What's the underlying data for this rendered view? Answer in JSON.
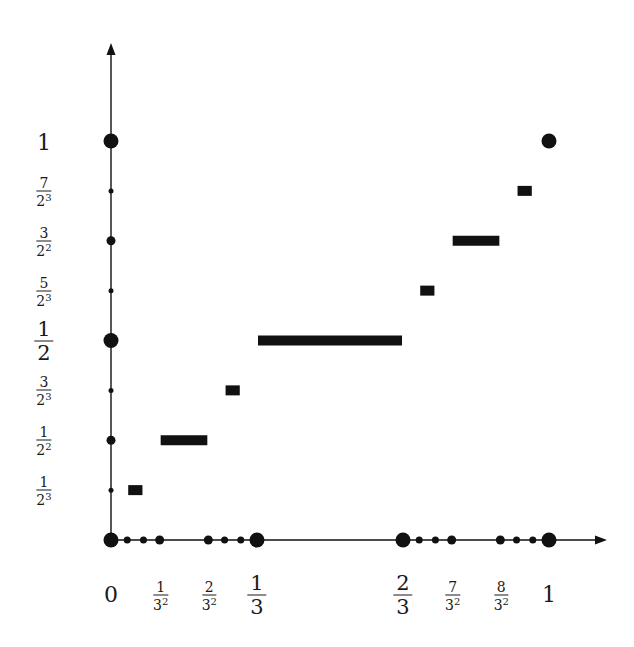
{
  "diagram": {
    "title": "",
    "colors": {
      "ink": "#111111",
      "background": "#ffffff"
    },
    "axes": {
      "origin_px": [
        111,
        540
      ],
      "x_end_px": 549,
      "y_end_px": 141,
      "x_arrow_tip_px": 607,
      "y_arrow_tip_px": 43
    },
    "x_labels": [
      {
        "value": 0,
        "kind": "whole",
        "text": "0"
      },
      {
        "value": 0.1111,
        "kind": "frac",
        "num": "1",
        "den": "3",
        "exp": "2"
      },
      {
        "value": 0.2222,
        "kind": "frac",
        "num": "2",
        "den": "3",
        "exp": "2"
      },
      {
        "value": 0.3333,
        "kind": "bigfrac",
        "num": "1",
        "den": "3",
        "exp": ""
      },
      {
        "value": 0.6667,
        "kind": "bigfrac",
        "num": "2",
        "den": "3",
        "exp": ""
      },
      {
        "value": 0.7778,
        "kind": "frac",
        "num": "7",
        "den": "3",
        "exp": "2"
      },
      {
        "value": 0.8889,
        "kind": "frac",
        "num": "8",
        "den": "3",
        "exp": "2"
      },
      {
        "value": 1,
        "kind": "whole",
        "text": "1"
      }
    ],
    "y_labels": [
      {
        "value": 1,
        "kind": "whole",
        "text": "1"
      },
      {
        "value": 0.875,
        "kind": "frac",
        "num": "7",
        "den": "2",
        "exp": "3"
      },
      {
        "value": 0.75,
        "kind": "frac",
        "num": "3",
        "den": "2",
        "exp": "2"
      },
      {
        "value": 0.625,
        "kind": "frac",
        "num": "5",
        "den": "2",
        "exp": "3"
      },
      {
        "value": 0.5,
        "kind": "bigfrac",
        "num": "1",
        "den": "2",
        "exp": ""
      },
      {
        "value": 0.375,
        "kind": "frac",
        "num": "3",
        "den": "2",
        "exp": "3"
      },
      {
        "value": 0.25,
        "kind": "frac",
        "num": "1",
        "den": "2",
        "exp": "2"
      },
      {
        "value": 0.125,
        "kind": "frac",
        "num": "1",
        "den": "2",
        "exp": "3"
      }
    ],
    "x_axis_dots": [
      {
        "x": 0,
        "size": "large"
      },
      {
        "x": 0.037,
        "size": "small"
      },
      {
        "x": 0.0741,
        "size": "small"
      },
      {
        "x": 0.1111,
        "size": "medium"
      },
      {
        "x": 0.2222,
        "size": "medium"
      },
      {
        "x": 0.2593,
        "size": "small"
      },
      {
        "x": 0.2963,
        "size": "small"
      },
      {
        "x": 0.3333,
        "size": "large"
      },
      {
        "x": 0.6667,
        "size": "large"
      },
      {
        "x": 0.7037,
        "size": "small"
      },
      {
        "x": 0.7407,
        "size": "small"
      },
      {
        "x": 0.7778,
        "size": "medium"
      },
      {
        "x": 0.8889,
        "size": "medium"
      },
      {
        "x": 0.9259,
        "size": "small"
      },
      {
        "x": 0.963,
        "size": "small"
      },
      {
        "x": 1,
        "size": "large"
      }
    ],
    "y_axis_dots": [
      {
        "y": 0.125,
        "size": "tiny"
      },
      {
        "y": 0.25,
        "size": "medium"
      },
      {
        "y": 0.375,
        "size": "tiny"
      },
      {
        "y": 0.5,
        "size": "large"
      },
      {
        "y": 0.625,
        "size": "tiny"
      },
      {
        "y": 0.75,
        "size": "medium"
      },
      {
        "y": 0.875,
        "size": "tiny"
      },
      {
        "y": 1,
        "size": "large"
      }
    ],
    "free_points": [
      {
        "x": 1,
        "y": 1,
        "size": "large"
      }
    ],
    "steps": [
      {
        "x0": 0.037,
        "x1": 0.0741,
        "y": 0.125
      },
      {
        "x0": 0.1111,
        "x1": 0.2222,
        "y": 0.25
      },
      {
        "x0": 0.2593,
        "x1": 0.2963,
        "y": 0.375
      },
      {
        "x0": 0.3333,
        "x1": 0.6667,
        "y": 0.5
      },
      {
        "x0": 0.7037,
        "x1": 0.7407,
        "y": 0.625
      },
      {
        "x0": 0.7778,
        "x1": 0.8889,
        "y": 0.75
      },
      {
        "x0": 0.9259,
        "x1": 0.963,
        "y": 0.875
      }
    ],
    "dot_radii": {
      "tiny": 2.5,
      "small": 3.5,
      "medium": 4.5,
      "large": 7.5
    },
    "bar_thickness": 10,
    "x_label_row_px": 595,
    "y_label_col_px": 44
  }
}
